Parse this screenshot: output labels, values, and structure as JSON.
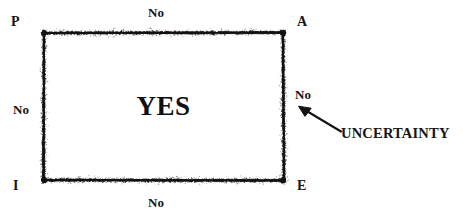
{
  "diagram": {
    "background_color": "#ffffff",
    "ink_color": "#141414",
    "center_label": "YES",
    "corners": [
      {
        "name": "top-left",
        "label": "P"
      },
      {
        "name": "top-right",
        "label": "A"
      },
      {
        "name": "bottom-left",
        "label": "I"
      },
      {
        "name": "bottom-right",
        "label": "E"
      }
    ],
    "edge_labels": [
      {
        "name": "top",
        "label": "No"
      },
      {
        "name": "left",
        "label": "No"
      },
      {
        "name": "right",
        "label": "No"
      },
      {
        "name": "bottom",
        "label": "No"
      }
    ],
    "annotation": {
      "label": "UNCERTAINTY",
      "arrow": {
        "from_x": 341,
        "from_y": 131,
        "to_x": 299,
        "to_y": 107
      }
    },
    "box": {
      "left": 44,
      "top": 33,
      "right": 283,
      "bottom": 180,
      "style": "sprayed-stipple-border",
      "band_thickness": 13
    }
  }
}
